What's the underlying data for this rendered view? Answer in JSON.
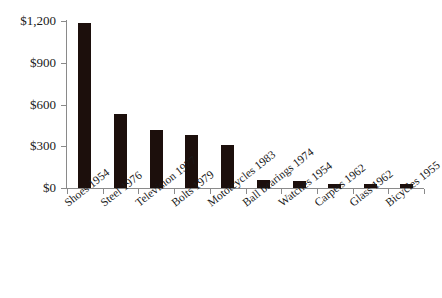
{
  "chart_data": {
    "type": "bar",
    "title": "",
    "subtitle": "",
    "xlabel": "",
    "ylabel": "",
    "categories": [
      "Shoes 1954",
      "Steel 1976",
      "Television 1977",
      "Bolts 1979",
      "Mototcycles 1983",
      "Ball bearings 1974",
      "Watches 1954",
      "Carpets 1962",
      "Glass 1962",
      "Bicycles 1955"
    ],
    "values": [
      1185,
      530,
      415,
      380,
      307,
      55,
      52,
      28,
      30,
      28
    ],
    "ylim": [
      0,
      1200
    ],
    "ytick_values": [
      0,
      300,
      600,
      900,
      1200
    ],
    "ytick_labels": [
      "$0",
      "$300",
      "$600",
      "$900",
      "$1,200"
    ],
    "grid": false,
    "legend": false,
    "legend_position": "none",
    "bar_color": "#1c0f0c",
    "axis_color": "#8a8a8a",
    "background_color": "#ffffff",
    "label_rotation_degrees": -38
  }
}
